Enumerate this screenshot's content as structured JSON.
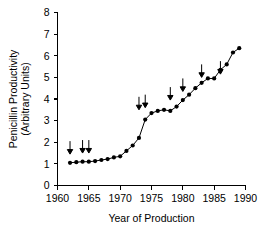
{
  "chart_data": {
    "type": "line",
    "title": "",
    "xlabel": "Year of Production",
    "ylabel": "Penicillin Productivity (Arbitrary Units)",
    "ylabel_line1": "Penicillin Productivity",
    "ylabel_line2": "(Arbitrary Units)",
    "xlim": [
      1960,
      1990
    ],
    "ylim": [
      0,
      8
    ],
    "xticks": [
      1960,
      1965,
      1970,
      1975,
      1980,
      1985,
      1990
    ],
    "yticks": [
      0,
      1,
      2,
      3,
      4,
      5,
      6,
      7,
      8
    ],
    "xtick_labels": [
      "1960",
      "1965",
      "1970",
      "1975",
      "1980",
      "1985",
      "1990"
    ],
    "ytick_labels": [
      "0",
      "1",
      "2",
      "3",
      "4",
      "5",
      "6",
      "7",
      "8"
    ],
    "grid": false,
    "legend": false,
    "marker": "filled-circle",
    "line_color": "#000000",
    "marker_color": "#000000",
    "x": [
      1962,
      1963,
      1964,
      1965,
      1966,
      1967,
      1968,
      1969,
      1970,
      1971,
      1972,
      1973,
      1974,
      1975,
      1976,
      1977,
      1978,
      1979,
      1980,
      1981,
      1982,
      1983,
      1984,
      1985,
      1986,
      1987,
      1988,
      1989
    ],
    "values": [
      1.05,
      1.08,
      1.1,
      1.1,
      1.13,
      1.18,
      1.22,
      1.3,
      1.35,
      1.6,
      1.85,
      2.2,
      3.05,
      3.35,
      3.45,
      3.5,
      3.45,
      3.65,
      3.95,
      4.2,
      4.5,
      4.75,
      4.95,
      4.95,
      5.35,
      5.6,
      6.15,
      6.35
    ],
    "annotations": {
      "type": "down-arrow",
      "description": "Downward arrows mark strain-improvement events",
      "items": [
        {
          "x": 1962,
          "y_tip": 1.45
        },
        {
          "x": 1964,
          "y_tip": 1.5
        },
        {
          "x": 1965,
          "y_tip": 1.5
        },
        {
          "x": 1973,
          "y_tip": 3.5
        },
        {
          "x": 1974,
          "y_tip": 3.6
        },
        {
          "x": 1978,
          "y_tip": 3.95
        },
        {
          "x": 1980,
          "y_tip": 4.35
        },
        {
          "x": 1983,
          "y_tip": 5.0
        },
        {
          "x": 1986,
          "y_tip": 5.15
        }
      ]
    }
  }
}
